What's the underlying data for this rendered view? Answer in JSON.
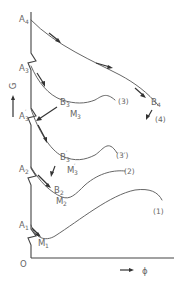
{
  "diagram": {
    "axes": {
      "y_label": "G",
      "x_label": "ϕ",
      "origin": "O"
    },
    "points": {
      "A1": {
        "base": "A",
        "sub": "1"
      },
      "A2": {
        "base": "A",
        "sub": "2"
      },
      "A3p": {
        "base": "A",
        "sub": "3",
        "prime": "′"
      },
      "A3": {
        "base": "A",
        "sub": "3"
      },
      "A4": {
        "base": "A",
        "sub": "4"
      },
      "M1": {
        "base": "M",
        "sub": "1"
      },
      "M2": {
        "base": "M",
        "sub": "2"
      },
      "B2": {
        "base": "B",
        "sub": "2"
      },
      "M3p": {
        "base": "M",
        "sub": "3",
        "prime": "′"
      },
      "B3p": {
        "base": "B",
        "sub": "3",
        "prime": "′"
      },
      "M3": {
        "base": "M",
        "sub": "3"
      },
      "B3": {
        "base": "B",
        "sub": "3"
      },
      "B4": {
        "base": "B",
        "sub": "4"
      }
    },
    "curves": {
      "c1": "(1)",
      "c2": "(2)",
      "c3p": "(3′)",
      "c3": "(3)",
      "c4": "(4)"
    },
    "colors": {
      "line": "#555555",
      "arrow": "#333333",
      "text": "#666666"
    }
  }
}
